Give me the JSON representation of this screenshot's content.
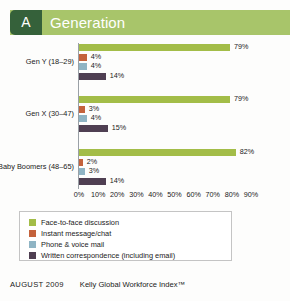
{
  "header": {
    "badge": "A",
    "title": "Generation",
    "badge_color": "#35613a",
    "banner_color": "#a8c56a"
  },
  "footer": {
    "date": "AUGUST 2009",
    "source": "Kelly Global Workforce Index™"
  },
  "legend": {
    "items": [
      {
        "label": "Face-to-face discussion",
        "color": "#a3bd48"
      },
      {
        "label": "Instant message/chat",
        "color": "#c4623c"
      },
      {
        "label": "Phone & voice mail",
        "color": "#8fb4c4"
      },
      {
        "label": "Written correspondence (including email)",
        "color": "#4f3f52"
      }
    ]
  },
  "chart_data": {
    "type": "bar",
    "orientation": "horizontal",
    "title": "Generation",
    "xlabel": "",
    "ylabel": "",
    "xlim": [
      0,
      90
    ],
    "grid": false,
    "legend_position": "bottom",
    "categories": [
      "Gen Y (18–29)",
      "Gen X (30–47)",
      "Baby Boomers (48–65)"
    ],
    "tick_labels": [
      "0%",
      "10%",
      "20%",
      "30%",
      "40%",
      "50%",
      "60%",
      "70%",
      "80%",
      "90%"
    ],
    "tick_values": [
      0,
      10,
      20,
      30,
      40,
      50,
      60,
      70,
      80,
      90
    ],
    "series": [
      {
        "name": "Face-to-face discussion",
        "color": "#a3bd48",
        "values": [
          79,
          79,
          82
        ],
        "labels": [
          "79%",
          "79%",
          "82%"
        ]
      },
      {
        "name": "Instant message/chat",
        "color": "#c4623c",
        "values": [
          4,
          3,
          2
        ],
        "labels": [
          "4%",
          "3%",
          "2%"
        ]
      },
      {
        "name": "Phone & voice mail",
        "color": "#8fb4c4",
        "values": [
          4,
          4,
          3
        ],
        "labels": [
          "4%",
          "4%",
          "3%"
        ]
      },
      {
        "name": "Written correspondence (including email)",
        "color": "#4f3f52",
        "values": [
          14,
          15,
          14
        ],
        "labels": [
          "14%",
          "15%",
          "14%"
        ]
      }
    ]
  }
}
